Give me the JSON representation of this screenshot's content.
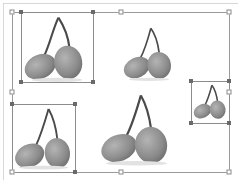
{
  "canvas": {
    "background": "#ffffff",
    "frame_color": "#d8d8d8"
  },
  "group_selection": {
    "box": {
      "x": 12,
      "y": 12,
      "w": 217,
      "h": 160
    },
    "handle_style": "hollow-square",
    "handles": [
      "top-left",
      "top-center",
      "top-right",
      "middle-left",
      "middle-right",
      "bottom-left",
      "bottom-center",
      "bottom-right"
    ]
  },
  "images": [
    {
      "id": "cherry-1",
      "selected": true,
      "box": {
        "x": 21,
        "y": 12,
        "w": 72,
        "h": 70
      }
    },
    {
      "id": "cherry-2",
      "selected": false,
      "box": {
        "x": 120,
        "y": 25,
        "w": 56,
        "h": 56
      }
    },
    {
      "id": "cherry-3",
      "selected": true,
      "box": {
        "x": 191,
        "y": 81,
        "w": 38,
        "h": 42
      }
    },
    {
      "id": "cherry-4",
      "selected": true,
      "box": {
        "x": 12,
        "y": 104,
        "w": 63,
        "h": 68
      }
    },
    {
      "id": "cherry-5",
      "selected": false,
      "box": {
        "x": 100,
        "y": 92,
        "w": 73,
        "h": 74
      }
    }
  ],
  "colors": {
    "selection_border": "#9a9a9a",
    "image_border": "#8c8c8c",
    "handle_dot": "#6a6a6a",
    "fruit": "#8e8e8e",
    "stem": "#4a4a4a"
  }
}
